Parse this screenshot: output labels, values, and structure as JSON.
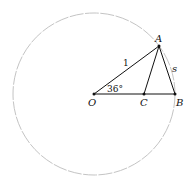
{
  "diagram": {
    "title": "",
    "points": {
      "O": {
        "label": "O",
        "x": 94,
        "y": 94
      },
      "A": {
        "label": "A",
        "x": 159,
        "y": 46
      },
      "B": {
        "label": "B",
        "x": 175,
        "y": 94
      },
      "C": {
        "label": "C",
        "x": 144,
        "y": 94
      }
    },
    "circle": {
      "center": "O",
      "radius": 81,
      "stroke": "#c8c8c8"
    },
    "segments": [
      [
        "O",
        "A"
      ],
      [
        "O",
        "B"
      ],
      [
        "A",
        "B"
      ],
      [
        "A",
        "C"
      ]
    ],
    "labels": {
      "OA_length": "1",
      "AB_length": "s",
      "angle_AOB": "36°"
    },
    "colors": {
      "line": "#111111",
      "circle": "#c8c8c8"
    }
  }
}
